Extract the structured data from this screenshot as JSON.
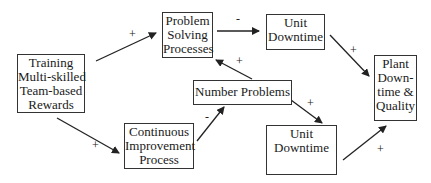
{
  "diagram": {
    "nodes": {
      "training": {
        "lines": [
          "Training",
          "Multi-skilled",
          "Team-based",
          "Rewards"
        ]
      },
      "problem_solving": {
        "lines": [
          "Problem",
          "Solving",
          "Processes"
        ]
      },
      "unit_downtime_top": {
        "lines": [
          "Unit",
          "Downtime"
        ]
      },
      "plant": {
        "lines": [
          "Plant",
          "Down-",
          "time &",
          "Quality"
        ]
      },
      "number_problems": {
        "lines": [
          "Number Problems"
        ]
      },
      "continuous_improvement": {
        "lines": [
          "Continuous",
          "Improvement",
          "Process"
        ]
      },
      "unit_downtime_bottom": {
        "lines": [
          "Unit",
          "Downtime"
        ]
      }
    },
    "edges": [
      {
        "from": "Training",
        "to": "Problem Solving Processes",
        "sign": "+"
      },
      {
        "from": "Problem Solving Processes",
        "to": "Unit Downtime (top)",
        "sign": "-"
      },
      {
        "from": "Unit Downtime (top)",
        "to": "Plant Downtime & Quality",
        "sign": "+"
      },
      {
        "from": "Number Problems",
        "to": "Problem Solving Processes",
        "sign": "+"
      },
      {
        "from": "Number Problems",
        "to": "Unit Downtime (bottom)",
        "sign": "+"
      },
      {
        "from": "Continuous Improvement Process",
        "to": "Number Problems",
        "sign": "-"
      },
      {
        "from": "Unit Downtime (bottom)",
        "to": "Plant Downtime & Quality",
        "sign": "+"
      },
      {
        "from": "Training",
        "to": "Continuous Improvement Process",
        "sign": "+"
      }
    ],
    "signs": {
      "training_to_ps": "+",
      "ps_to_ud_top": "-",
      "ud_top_to_plant": "+",
      "np_to_ps": "+",
      "np_to_ud_bottom": "+",
      "ci_to_np": "-",
      "ud_bottom_to_plant": "+",
      "training_to_ci": "+"
    },
    "colors": {
      "line": "#222222",
      "border": "#333333",
      "background": "#ffffff"
    }
  }
}
